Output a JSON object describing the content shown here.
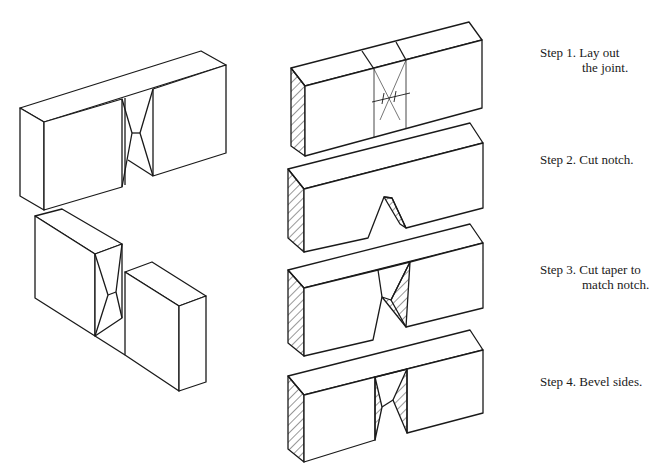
{
  "figure": {
    "left_illustration": "Assembled and exploded views of the joint",
    "steps": [
      {
        "label": "Step 1. Lay out",
        "label2": "the joint."
      },
      {
        "label": "Step 2. Cut notch.",
        "label2": ""
      },
      {
        "label": "Step 3. Cut taper to",
        "label2": "match notch."
      },
      {
        "label": "Step 4. Bevel sides.",
        "label2": ""
      }
    ]
  },
  "colors": {
    "line": "#1a1a1a",
    "background": "#ffffff"
  }
}
